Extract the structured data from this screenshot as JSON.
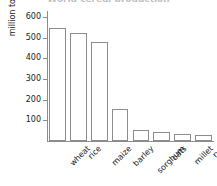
{
  "chart_data": {
    "type": "bar",
    "title": "World cereal production",
    "categories": [
      "wheat",
      "rice",
      "maize",
      "barley",
      "sorghum",
      "oats",
      "millet",
      "rye"
    ],
    "values": [
      550,
      525,
      478,
      155,
      55,
      42,
      32,
      28
    ],
    "xlabel": "",
    "ylabel": "million tonnes",
    "ylim": [
      0,
      630
    ],
    "yticks": [
      100,
      200,
      300,
      400,
      500,
      600
    ],
    "ytick_labels": [
      "100",
      "200",
      "300",
      "400",
      "500",
      "600"
    ],
    "grid": false,
    "legend": null,
    "bar_fill_color": "#ffffff",
    "bar_edge_color": "#8c8c8c",
    "axis_color": "#8c8c8c",
    "text_color": "#1a1a1a",
    "background_color": "#ffffff"
  }
}
